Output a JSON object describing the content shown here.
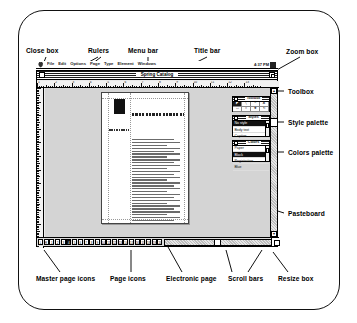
{
  "figure": {
    "callouts_top": [
      {
        "id": "close-box",
        "label": "Close box"
      },
      {
        "id": "rulers",
        "label": "Rulers"
      },
      {
        "id": "menu-bar",
        "label": "Menu bar"
      },
      {
        "id": "title-bar",
        "label": "Title bar"
      },
      {
        "id": "zoom-box",
        "label": "Zoom box"
      }
    ],
    "callouts_right": [
      {
        "id": "toolbox",
        "label": "Toolbox"
      },
      {
        "id": "style-palette",
        "label": "Style palette"
      },
      {
        "id": "colors-palette",
        "label": "Colors palette"
      },
      {
        "id": "pasteboard",
        "label": "Pasteboard"
      }
    ],
    "callouts_bottom": [
      {
        "id": "master-page-icons",
        "label": "Master page icons"
      },
      {
        "id": "page-icons",
        "label": "Page icons"
      },
      {
        "id": "electronic-page",
        "label": "Electronic page"
      },
      {
        "id": "scroll-bars",
        "label": "Scroll bars"
      },
      {
        "id": "resize-box",
        "label": "Resize box"
      }
    ]
  },
  "menubar": {
    "apple_icon": "apple-icon",
    "items": [
      "File",
      "Edit",
      "Options",
      "Page",
      "Type",
      "Element",
      "Windows"
    ],
    "clock": "4:37 PM",
    "app_icon": "application-menu-icon"
  },
  "window": {
    "title": "Spring Catalog",
    "close_icon": "close-box-icon",
    "zoom_icon": "zoom-box-icon"
  },
  "rulers": {
    "horizontal_numbers": [
      "1",
      "2",
      "3",
      "4",
      "5",
      "6",
      "7",
      "8",
      "9",
      "10",
      "11",
      "12",
      "13"
    ],
    "unit": "inches"
  },
  "page": {
    "headline": "Aldus Training Programs Handbook",
    "subhead": "CONTENTS",
    "graphic": "black-box-graphic"
  },
  "toolbox": {
    "title": "Toolbox",
    "tools": [
      {
        "name": "pointer-tool",
        "glyph": "◤",
        "selected": true
      },
      {
        "name": "diagonal-line-tool",
        "glyph": "╲",
        "selected": false
      },
      {
        "name": "perpendicular-line-tool",
        "glyph": "└",
        "selected": false
      },
      {
        "name": "text-tool",
        "glyph": "A",
        "selected": false
      },
      {
        "name": "rectangle-tool",
        "glyph": "▭",
        "selected": false
      },
      {
        "name": "ellipse-tool",
        "glyph": "○",
        "selected": false
      },
      {
        "name": "cropping-tool",
        "glyph": "✚",
        "selected": false
      },
      {
        "name": "rotate-tool",
        "glyph": "↻",
        "selected": false
      }
    ]
  },
  "styles": {
    "title": "Styles",
    "items": [
      {
        "label": "No style",
        "selected": true
      },
      {
        "label": "Body text",
        "selected": false
      },
      {
        "label": "Caption",
        "selected": false
      },
      {
        "label": "Headline",
        "selected": false
      }
    ]
  },
  "colors": {
    "title": "Colors",
    "items": [
      {
        "label": "Paper",
        "selected": false
      },
      {
        "label": "Black",
        "selected": true
      },
      {
        "label": "Registration",
        "selected": false
      },
      {
        "label": "Blue",
        "selected": false
      }
    ]
  },
  "pageicons": {
    "master_left": "L",
    "master_right": "R",
    "pages": [
      "1",
      "2",
      "3",
      "4",
      "5",
      "6",
      "7",
      "8",
      "9",
      "10",
      "11",
      "12",
      "13",
      "14",
      "15",
      "16",
      "17",
      "18",
      "19",
      "20"
    ],
    "current_page": "4"
  },
  "scrollbars": {
    "up_arrow": "▲",
    "down_arrow": "▼"
  }
}
